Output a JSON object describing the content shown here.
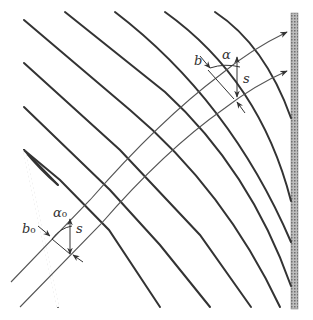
{
  "diagram": {
    "type": "wave-refraction",
    "labels": {
      "b_far": "b",
      "alpha_far": "α",
      "s_far": "s",
      "b_near": "b",
      "b_near_sub": "o",
      "alpha_near": "α",
      "alpha_near_sub": "o",
      "s_near": "s"
    },
    "colors": {
      "crest": "#333333",
      "ray": "#555555",
      "wall": "#8a8a8a"
    }
  }
}
